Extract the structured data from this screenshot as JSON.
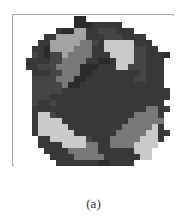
{
  "figure": {
    "caption": "(a)",
    "palette": {
      "0": "#ffffff",
      "1": "#2b2b2b",
      "2": "#383838",
      "3": "#454545",
      "4": "#787878",
      "5": "#a3a3a3",
      "6": "#cacaca"
    },
    "grid": {
      "cols": 27,
      "rows": 25,
      "cell_px": 6,
      "rows_data": [
        "000000000011000000000000000",
        "000000000011122222000000000",
        "000000021155223332220000000",
        "000002255555222333222200000",
        "000022555554432666662220000",
        "000221555544422666663322000",
        "000321335444422266663322210",
        "002222334444221126663322200",
        "002233344441112226633322200",
        "000222334441122222222322200",
        "000333344411222222223322200",
        "000333334112222222222222200",
        "000333332222222222222222220",
        "000333222222222222222222220",
        "000322322222222222222222200",
        "000222222222222222222244220",
        "000266322222222222224444200",
        "000266662222222222244444400",
        "000266666222222222444446200",
        "000266666622222224444466220",
        "000022666666322244444666200",
        "000022226666442244446666000",
        "000002222444442222226660000",
        "000000222244444222222660000",
        "000000022222221122220000000"
      ]
    }
  }
}
